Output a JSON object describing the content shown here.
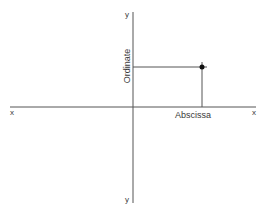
{
  "diagram": {
    "axes": {
      "x_left_label": "x",
      "x_right_label": "x",
      "y_top_label": "y",
      "y_bottom_label": "y"
    },
    "point": {
      "abscissa_label": "Abscissa",
      "ordinate_label": "Ordinate"
    },
    "colors": {
      "line": "#555555",
      "text": "#3a3a3a",
      "point": "#111111",
      "background": "#ffffff"
    }
  }
}
